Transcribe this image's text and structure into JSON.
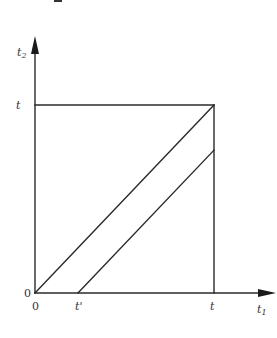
{
  "diagram": {
    "axes": {
      "x_label": "t",
      "x_label_subscript": "1",
      "y_label": "t",
      "y_label_subscript": "2"
    },
    "labels": {
      "origin_left": "0",
      "origin_below": "0",
      "t_prime": "t'",
      "t_on_x_axis": "t",
      "t_on_y_axis": "t"
    },
    "elements": [
      {
        "name": "square",
        "corners": [
          [
            0,
            0
          ],
          [
            1,
            0
          ],
          [
            1,
            1
          ],
          [
            0,
            1
          ]
        ],
        "units": "t"
      },
      {
        "name": "main-diagonal",
        "from": [
          0,
          0
        ],
        "to": [
          1,
          1
        ],
        "units": "t"
      },
      {
        "name": "shifted-diagonal",
        "from": [
          0.24,
          0
        ],
        "to": [
          1,
          0.76
        ],
        "units": "t"
      }
    ],
    "t_prime_fraction": 0.24
  }
}
